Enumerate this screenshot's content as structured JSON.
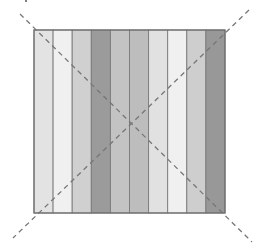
{
  "figure": {
    "square": {
      "x": 34,
      "y": 30,
      "width": 191,
      "height": 183,
      "border_color": "#6e6e6e"
    },
    "stripes": [
      {
        "index": 1,
        "color": "#e3e3e3"
      },
      {
        "index": 2,
        "color": "#f0f0f0"
      },
      {
        "index": 3,
        "color": "#d0d0d0"
      },
      {
        "index": 4,
        "color": "#9b9b9b"
      },
      {
        "index": 5,
        "color": "#c3c3c3"
      },
      {
        "index": 6,
        "color": "#bdbdbd"
      },
      {
        "index": 7,
        "color": "#e1e1e1"
      },
      {
        "index": 8,
        "color": "#f0f0f0"
      },
      {
        "index": 9,
        "color": "#cecece"
      },
      {
        "index": 10,
        "color": "#989898"
      }
    ],
    "stripe_divider_color": "#7a7a7a",
    "diagonals": [
      {
        "name": "top-left-to-bottom-right",
        "x1": 20,
        "y1": 14,
        "x2": 252,
        "y2": 242,
        "color": "#777777",
        "dash": "5,4"
      },
      {
        "name": "top-right-to-bottom-left",
        "x1": 249,
        "y1": 10,
        "x2": 13,
        "y2": 238,
        "color": "#777777",
        "dash": "5,4"
      }
    ]
  }
}
